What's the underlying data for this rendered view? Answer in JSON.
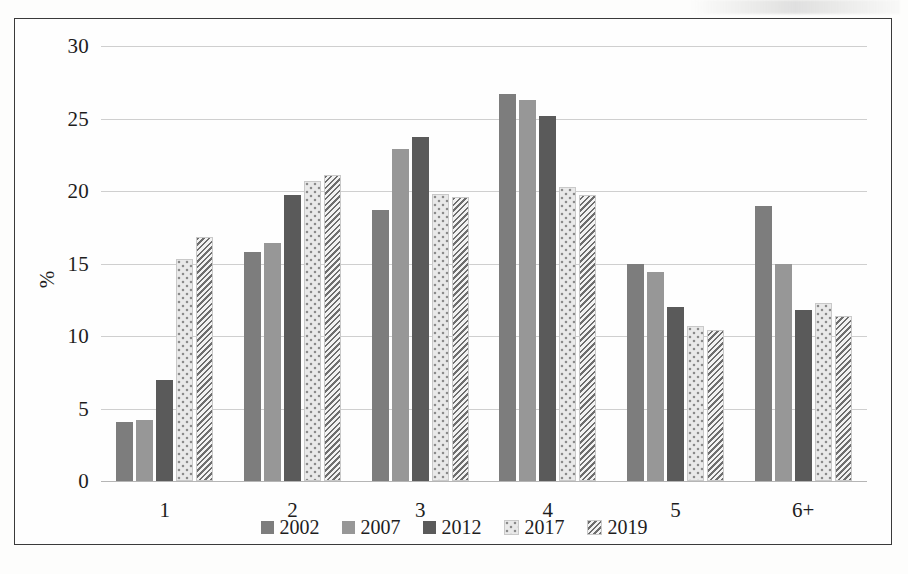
{
  "chart_data": {
    "type": "bar",
    "title": "",
    "subtitle": "",
    "xlabel": "",
    "ylabel": "%",
    "categories": [
      "1",
      "2",
      "3",
      "4",
      "5",
      "6+"
    ],
    "ylim": [
      0,
      30
    ],
    "yticks": [
      0,
      5,
      10,
      15,
      20,
      25,
      30
    ],
    "grid": true,
    "legend_position": "bottom",
    "series": [
      {
        "name": "2002",
        "color": "#7d7d7d",
        "pattern": "solid",
        "values": [
          4.1,
          15.8,
          18.7,
          26.7,
          15.0,
          19.0
        ]
      },
      {
        "name": "2007",
        "color": "#979797",
        "pattern": "solid",
        "values": [
          4.2,
          16.4,
          22.9,
          26.3,
          14.4,
          15.0
        ]
      },
      {
        "name": "2012",
        "color": "#5a5a5a",
        "pattern": "solid",
        "values": [
          7.0,
          19.7,
          23.7,
          25.2,
          12.0,
          11.8
        ]
      },
      {
        "name": "2017",
        "color": "#e9e9e9",
        "pattern": "dotted",
        "values": [
          15.3,
          20.7,
          19.8,
          20.3,
          10.7,
          12.3
        ]
      },
      {
        "name": "2019",
        "color": "#ededed",
        "pattern": "diagonal-hatch",
        "values": [
          16.8,
          21.1,
          19.6,
          19.7,
          10.4,
          11.4
        ]
      }
    ]
  },
  "axis": {
    "y_title": "%",
    "y_tick_labels": [
      "0",
      "5",
      "10",
      "15",
      "20",
      "25",
      "30"
    ],
    "x_tick_labels": [
      "1",
      "2",
      "3",
      "4",
      "5",
      "6+"
    ]
  },
  "legend": {
    "entries": [
      {
        "label": "2002"
      },
      {
        "label": "2007"
      },
      {
        "label": "2012"
      },
      {
        "label": "2017"
      },
      {
        "label": "2019"
      }
    ]
  }
}
